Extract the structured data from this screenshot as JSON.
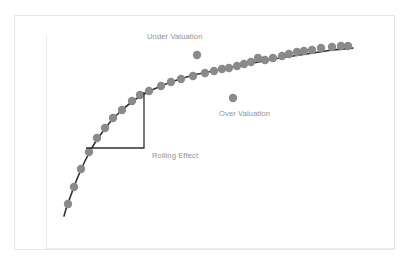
{
  "page": {
    "background_color": "#ffffff",
    "cropped_header_text": "——  ——  ———  —— ——"
  },
  "card": {
    "border_color": "#e6e6ea",
    "background_color": "#ffffff"
  },
  "annotations": {
    "under_valuation": "Under Valuation",
    "over_valuation": "Over Valuation",
    "rolling_effect": "Rolling Effect"
  },
  "chart_data": {
    "type": "scatter",
    "title": "",
    "subtitle": "",
    "xlabel": "",
    "ylabel": "",
    "xlim": [
      0,
      100
    ],
    "ylim": [
      0,
      100
    ],
    "grid": false,
    "legend_position": "none",
    "axis_color": "#ececf0",
    "point_color": "#8a8a8a",
    "point_radius": 4.2,
    "curve_color": "#2f2f2f",
    "curve_width": 1.6,
    "bracket_color": "#2f2f2f",
    "bracket_width": 1.3,
    "series": [
      {
        "name": "Fitted trend curve",
        "type": "line",
        "points": [
          [
            63,
            215
          ],
          [
            66,
            205
          ],
          [
            70,
            194
          ],
          [
            74,
            183
          ],
          [
            79,
            171
          ],
          [
            85,
            158
          ],
          [
            92,
            145
          ],
          [
            100,
            133
          ],
          [
            110,
            120
          ],
          [
            120,
            110
          ],
          [
            132,
            100
          ],
          [
            145,
            92
          ],
          [
            160,
            85
          ],
          [
            176,
            79
          ],
          [
            193,
            74
          ],
          [
            212,
            70
          ],
          [
            232,
            66
          ],
          [
            252,
            62
          ],
          [
            272,
            58
          ],
          [
            292,
            55
          ],
          [
            312,
            52
          ],
          [
            332,
            49
          ],
          [
            352,
            47
          ]
        ]
      },
      {
        "name": "Observations",
        "type": "scatter",
        "points": [
          [
            67,
            203
          ],
          [
            73,
            186
          ],
          [
            80,
            168
          ],
          [
            88,
            151
          ],
          [
            96,
            137
          ],
          [
            104,
            127
          ],
          [
            112,
            117
          ],
          [
            121,
            109
          ],
          [
            131,
            100
          ],
          [
            139,
            94
          ],
          [
            148,
            90
          ],
          [
            160,
            85
          ],
          [
            170,
            81
          ],
          [
            180,
            78
          ],
          [
            192,
            75
          ],
          [
            204,
            72
          ],
          [
            213,
            70
          ],
          [
            221,
            68
          ],
          [
            228,
            67
          ],
          [
            236,
            65
          ],
          [
            243,
            63
          ],
          [
            250,
            61
          ],
          [
            257,
            57
          ],
          [
            264,
            59
          ],
          [
            272,
            57
          ],
          [
            281,
            55
          ],
          [
            288,
            53
          ],
          [
            296,
            51
          ],
          [
            303,
            50
          ],
          [
            311,
            49
          ],
          [
            320,
            47
          ],
          [
            331,
            46
          ],
          [
            340,
            45
          ],
          [
            347,
            45
          ]
        ]
      },
      {
        "name": "Under Valuation outlier",
        "type": "scatter",
        "points": [
          [
            196,
            54
          ]
        ]
      },
      {
        "name": "Over Valuation outlier",
        "type": "scatter",
        "points": [
          [
            232,
            97
          ]
        ]
      }
    ],
    "bracket": {
      "name": "Rolling Effect right-angle bracket",
      "vertical": {
        "x": 143,
        "y_top": 91,
        "y_bottom": 147
      },
      "horizontal": {
        "y": 147,
        "x_left": 85,
        "x_right": 143
      }
    }
  }
}
